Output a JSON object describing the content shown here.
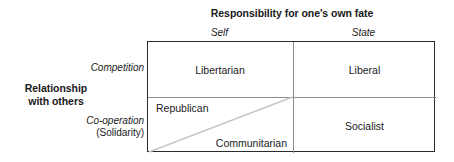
{
  "diagram": {
    "column_axis": {
      "title": "Responsibility for one's own fate",
      "labels": [
        "Self",
        "State"
      ]
    },
    "row_axis": {
      "title_line1": "Relationship",
      "title_line2": "with others",
      "labels": {
        "top": "Competition",
        "bottom_italic": "Co-operation",
        "bottom_roman": "(Solidarity)"
      }
    },
    "cells": {
      "self_competition": "Libertarian",
      "state_competition": "Liberal",
      "self_cooperation_upper": "Republican",
      "self_cooperation_lower": "Communitarian",
      "state_cooperation": "Socialist"
    },
    "colors": {
      "border": "#2b2b2b",
      "divider": "#8c8c8c",
      "diagonal": "#c6c6c6",
      "background": "#ffffff",
      "text": "#1a1a1a"
    }
  }
}
